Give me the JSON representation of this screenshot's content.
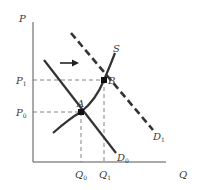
{
  "diagram": {
    "type": "supply-demand",
    "axes": {
      "y_label": "P",
      "x_label": "Q"
    },
    "price_levels": [
      {
        "label": "P",
        "sub": "1"
      },
      {
        "label": "P",
        "sub": "0"
      }
    ],
    "quantity_levels": [
      {
        "label": "Q",
        "sub": "0"
      },
      {
        "label": "Q",
        "sub": "1"
      }
    ],
    "curves": {
      "supply": {
        "label": "S"
      },
      "demand_initial": {
        "label": "D",
        "sub": "0"
      },
      "demand_shifted": {
        "label": "D",
        "sub": "1",
        "style": "dashed"
      }
    },
    "points": [
      {
        "label": "A"
      },
      {
        "label": "B"
      }
    ],
    "shift_arrow": "right-arrow",
    "colors": {
      "lines": "#333333",
      "guides": "#555555",
      "background": "#ffffff"
    }
  }
}
